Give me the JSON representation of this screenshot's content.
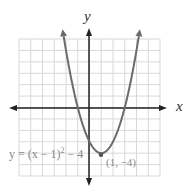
{
  "chart_data": {
    "type": "line",
    "title": "",
    "xlabel": "x",
    "ylabel": "y",
    "xlim": [
      -6,
      6
    ],
    "ylim": [
      -6,
      6
    ],
    "grid": true,
    "series": [
      {
        "name": "y = (x − 1)² − 4",
        "function": "(x-1)^2-4",
        "x": [
          -2.6,
          -2,
          -1,
          0,
          1,
          2,
          3,
          4,
          4.6
        ],
        "values": [
          8.96,
          5,
          0,
          -3,
          -4,
          -3,
          0,
          5,
          8.96
        ]
      }
    ],
    "annotations": [
      {
        "text": "y = (x − 1)² − 4",
        "position": "lower-left"
      },
      {
        "text": "(1, −4)",
        "x": 1,
        "y": -4,
        "marker": "vertex"
      }
    ],
    "colors": {
      "curve": "#6b6b6b",
      "axis": "#222222",
      "grid": "#d8d8d8"
    }
  },
  "labels": {
    "x_axis": "x",
    "y_axis": "y",
    "equation_prefix": "y = (x − 1)",
    "equation_exp": "2",
    "equation_suffix": " − 4",
    "vertex": "(1, −4)"
  }
}
